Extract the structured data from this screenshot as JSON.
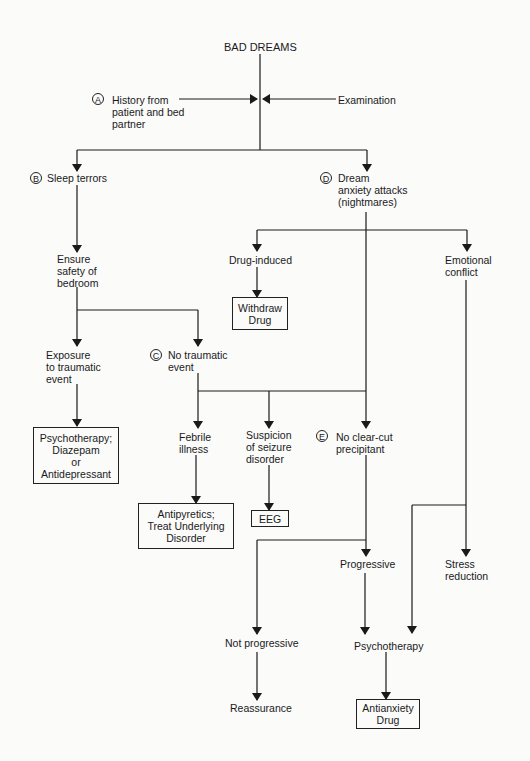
{
  "title": "BAD DREAMS",
  "nodes": {
    "a_label": "A",
    "history": "History from\npatient and bed\npartner",
    "examination": "Examination",
    "b_label": "B",
    "sleep_terrors": "Sleep terrors",
    "d_label": "D",
    "dream_anxiety": "Dream\nanxiety attacks\n(nightmares)",
    "ensure_safety": "Ensure\nsafety of\nbedroom",
    "drug_induced": "Drug-induced",
    "emotional_conflict": "Emotional\nconflict",
    "withdraw_drug": "Withdraw\nDrug",
    "exposure": "Exposure\nto traumatic\nevent",
    "c_label": "C",
    "no_traumatic": "No traumatic\nevent",
    "psychotherapy_diazepam": "Psychotherapy;\nDiazepam\nor\nAntidepressant",
    "febrile": "Febrile\nillness",
    "seizure": "Suspicion\nof seizure\ndisorder",
    "e_label": "E",
    "no_clear_cut": "No clear-cut\nprecipitant",
    "antipyretics": "Antipyretics;\nTreat Underlying\nDisorder",
    "eeg": "EEG",
    "progressive": "Progressive",
    "stress_reduction": "Stress\nreduction",
    "not_progressive": "Not progressive",
    "psychotherapy": "Psychotherapy",
    "reassurance": "Reassurance",
    "antianxiety": "Antianxiety\nDrug"
  },
  "colors": {
    "line": "#1a1a1a",
    "background": "#fbfbfa"
  }
}
